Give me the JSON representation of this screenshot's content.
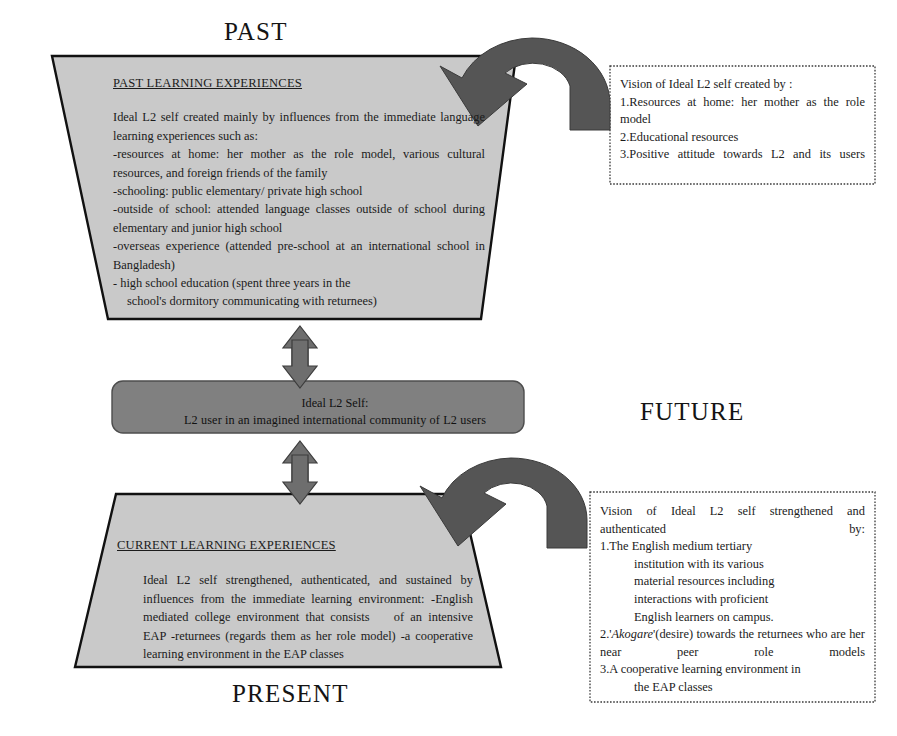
{
  "diagram": {
    "title_labels": {
      "past": "PAST",
      "future": "FUTURE",
      "present": "PRESENT"
    },
    "past_box": {
      "heading": "PAST LEARNING EXPERIENCES",
      "paragraph": "Ideal L2 self created mainly by influences from the immediate language  learning experiences such as:",
      "lines": [
        "-resources at home: her mother as the role model, various cultural resources, and foreign friends of the family",
        "-schooling: public  elementary/ private high school",
        "-outside of school: attended language classes outside of school during  elementary and junior high school",
        "-overseas   experience (attended pre-school at   an international school in Bangladesh)",
        "- high school education (spent three years  in the",
        "school's dormitory communicating with returnees)"
      ],
      "fill": "#c9c9c9"
    },
    "core_box": {
      "line1": "Ideal L2 Self:",
      "line2": "L2 user in an imagined  international  community of L2 users",
      "fill": "#808080"
    },
    "present_box": {
      "heading": "CURRENT LEARNING EXPERIENCES",
      "lines": [
        "Ideal L2 self strengthened, authenticated, and sustained by",
        "influences from the immediate learning environment:",
        "-English mediated college environment that consists",
        "of an intensive EAP",
        "-returnees (regards them as her role model)",
        "-a cooperative learning environment in the EAP classes"
      ],
      "fill": "#c9c9c9"
    },
    "vision_past_box": {
      "title": "Vision of  Ideal L2 self  created  by :",
      "items": [
        "1.Resources at home: her mother as the role model",
        "2.Educational resources",
        "3.Positive  attitude  towards  L2  and  its users"
      ]
    },
    "vision_present_box": {
      "title": "Vision  of  Ideal  L2  self  strengthened  and authenticated by:",
      "item1_lines": [
        "1.The English medium tertiary",
        "institution with its  various",
        "material   resources including",
        "interactions  with  proficient",
        "English learners on  campus."
      ],
      "item2_prefix": "2.'",
      "item2_italic": "Akogare",
      "item2_rest": "'(desire)  towards  the  returnees who are her near peer role models",
      "item3_lines": [
        "3.A cooperative learning environment in",
        "the EAP classes"
      ]
    },
    "arrows": {
      "vertical_top": "double-headed-vertical-arrow",
      "vertical_bottom": "double-headed-vertical-arrow",
      "curve_top": "curved-arrow-right-to-left",
      "curve_bottom": "curved-arrow-right-to-left",
      "fill": "#6e6e6e"
    }
  }
}
